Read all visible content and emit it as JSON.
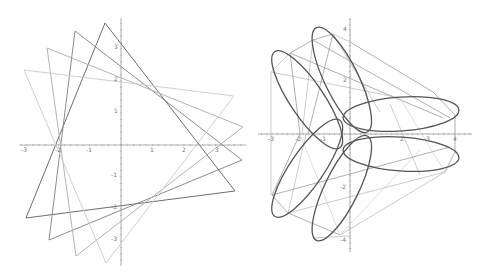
{
  "figure": {
    "width": 485,
    "height": 278,
    "background": "#ffffff"
  },
  "colors": {
    "axis": "#9a9a9a",
    "tick": "#9a9a9a",
    "label": "#7a7a7a",
    "curve": "#555555",
    "line_dark": "#6e6e6e",
    "line_mid": "#8c8c8c",
    "line_light": "#b4b4b4",
    "line_faint": "#cfcfcf"
  },
  "chart_data": [
    {
      "type": "line",
      "title": "",
      "description": "Four overlapping rotated triangles",
      "xlim": [
        -3.1,
        3.9
      ],
      "ylim": [
        -4.0,
        3.9
      ],
      "grid": false,
      "origin_px": [
        121,
        145
      ],
      "unit_px": [
        31.5,
        32.0
      ],
      "axes": {
        "x_axis": {
          "x1": 20,
          "x2": 246,
          "y": 145
        },
        "y_axis": {
          "x": 121,
          "y1": 18,
          "y2": 266
        }
      },
      "x_ticks": [
        {
          "label": "-3",
          "x": 24,
          "y": 152
        },
        {
          "label": "-2",
          "x": 58,
          "y": 152
        },
        {
          "label": "-1",
          "x": 89,
          "y": 152
        },
        {
          "label": "1",
          "x": 152,
          "y": 152
        },
        {
          "label": "2",
          "x": 184,
          "y": 152
        },
        {
          "label": "3",
          "x": 217,
          "y": 152
        }
      ],
      "y_ticks": [
        {
          "label": "3",
          "x": 116,
          "y": 49
        },
        {
          "label": "2",
          "x": 116,
          "y": 81
        },
        {
          "label": "1",
          "x": 116,
          "y": 113
        },
        {
          "label": "-1",
          "x": 114,
          "y": 177
        },
        {
          "label": "-2",
          "x": 114,
          "y": 209
        },
        {
          "label": "-3",
          "x": 114,
          "y": 241
        }
      ],
      "series": [
        {
          "name": "triangle-1",
          "shade": "line_dark",
          "points_px": [
            [
              105,
              23
            ],
            [
              235,
              191
            ],
            [
              26,
              218
            ]
          ],
          "points": [
            [
              -0.5,
              3.8
            ],
            [
              3.6,
              -1.45
            ],
            [
              -3.0,
              -2.3
            ]
          ]
        },
        {
          "name": "triangle-2",
          "shade": "line_mid",
          "points_px": [
            [
              75,
              31
            ],
            [
              242,
              160
            ],
            [
              49,
              240
            ]
          ],
          "points": [
            [
              -1.45,
              3.55
            ],
            [
              3.85,
              -0.5
            ],
            [
              -2.3,
              -3.0
            ]
          ]
        },
        {
          "name": "triangle-3",
          "shade": "line_light",
          "points_px": [
            [
              47,
              48
            ],
            [
              243,
              127
            ],
            [
              76,
              256
            ]
          ],
          "points": [
            [
              -2.35,
              3.0
            ],
            [
              3.85,
              0.55
            ],
            [
              -1.45,
              -3.5
            ]
          ]
        },
        {
          "name": "triangle-4",
          "shade": "line_faint",
          "points_px": [
            [
              24,
              70
            ],
            [
              234,
              96
            ],
            [
              106,
              263
            ]
          ],
          "points": [
            [
              -3.1,
              2.35
            ],
            [
              3.6,
              1.55
            ],
            [
              -0.5,
              -3.7
            ]
          ]
        }
      ]
    },
    {
      "type": "line",
      "title": "",
      "description": "Six-loop curve with three-fold symmetry and inscribed polygon lines",
      "xlim": [
        -3.5,
        4.5
      ],
      "ylim": [
        -4.3,
        4.3
      ],
      "grid": false,
      "origin_px": [
        350,
        134
      ],
      "unit_px": [
        26,
        26
      ],
      "axes": {
        "x_axis": {
          "x1": 258,
          "x2": 472,
          "y": 134
        },
        "y_axis": {
          "x": 350,
          "y1": 18,
          "y2": 252
        }
      },
      "x_ticks": [
        {
          "label": "-3",
          "x": 271,
          "y": 141
        },
        {
          "label": "-2",
          "x": 298,
          "y": 141
        },
        {
          "label": "-1",
          "x": 323,
          "y": 141
        },
        {
          "label": "2",
          "x": 402,
          "y": 141
        },
        {
          "label": "3",
          "x": 428,
          "y": 141
        },
        {
          "label": "4",
          "x": 455,
          "y": 141
        }
      ],
      "y_ticks": [
        {
          "label": "4",
          "x": 345,
          "y": 31
        },
        {
          "label": "2",
          "x": 345,
          "y": 82
        },
        {
          "label": "-2",
          "x": 343,
          "y": 189
        },
        {
          "label": "-4",
          "x": 343,
          "y": 242
        }
      ],
      "loops": {
        "center_px": [
          350,
          134
        ],
        "base_offset_px": [
          51,
          -20
        ],
        "semi_major_px": 58,
        "semi_minor_px": 17,
        "base_angle_deg": -4,
        "symmetry": "D3 (rotations of 120 degrees plus mirror)"
      },
      "lines_px": [
        {
          "shade": "line_mid",
          "pts": [
            [
              350,
              42
            ],
            [
              433,
              92
            ]
          ]
        },
        {
          "shade": "line_mid",
          "pts": [
            [
              313,
              40
            ],
            [
              333,
              34
            ]
          ]
        },
        {
          "shade": "line_mid",
          "pts": [
            [
              290,
              53
            ],
            [
              313,
              40
            ]
          ]
        },
        {
          "shade": "line_light",
          "pts": [
            [
              333,
              34
            ],
            [
              350,
              42
            ]
          ]
        },
        {
          "shade": "line_light",
          "pts": [
            [
              271,
              72
            ],
            [
              290,
              53
            ]
          ]
        },
        {
          "shade": "line_mid",
          "pts": [
            [
              290,
              53
            ],
            [
              443,
              118
            ]
          ]
        },
        {
          "shade": "line_mid",
          "pts": [
            [
              313,
              40
            ],
            [
              450,
              118
            ]
          ]
        },
        {
          "shade": "line_light",
          "pts": [
            [
              271,
              72
            ],
            [
              400,
              98
            ]
          ]
        },
        {
          "shade": "line_mid",
          "pts": [
            [
              290,
              53
            ],
            [
              300,
              134
            ]
          ]
        },
        {
          "shade": "line_mid",
          "pts": [
            [
              333,
              34
            ],
            [
              308,
              134
            ]
          ]
        },
        {
          "shade": "line_light",
          "pts": [
            [
              313,
              40
            ],
            [
              302,
              134
            ]
          ]
        },
        {
          "shade": "line_light",
          "pts": [
            [
              333,
              34
            ],
            [
              380,
              112
            ]
          ]
        },
        {
          "shade": "line_mid",
          "pts": [
            [
              433,
              92
            ],
            [
              455,
              115
            ]
          ]
        },
        {
          "shade": "line_light",
          "pts": [
            [
              271,
              72
            ],
            [
              271,
              195
            ]
          ]
        },
        {
          "shade": "line_mid",
          "pts": [
            [
              455,
              115
            ],
            [
              455,
              152
            ]
          ]
        },
        {
          "shade": "line_mid",
          "pts": [
            [
              272,
              195
            ],
            [
              450,
              147
            ]
          ]
        },
        {
          "shade": "line_mid",
          "pts": [
            [
              272,
              195
            ],
            [
              288,
              213
            ]
          ]
        },
        {
          "shade": "line_mid",
          "pts": [
            [
              288,
              213
            ],
            [
              340,
              235
            ]
          ]
        },
        {
          "shade": "line_light",
          "pts": [
            [
              288,
              213
            ],
            [
              445,
              172
            ]
          ]
        },
        {
          "shade": "line_light",
          "pts": [
            [
              340,
              235
            ],
            [
              445,
              172
            ]
          ]
        },
        {
          "shade": "line_mid",
          "pts": [
            [
              272,
              195
            ],
            [
              300,
              134
            ]
          ]
        },
        {
          "shade": "line_light",
          "pts": [
            [
              288,
              213
            ],
            [
              306,
              134
            ]
          ]
        },
        {
          "shade": "line_light",
          "pts": [
            [
              313,
              238
            ],
            [
              350,
              236
            ]
          ]
        },
        {
          "shade": "line_mid",
          "pts": [
            [
              445,
              172
            ],
            [
              455,
              152
            ]
          ]
        },
        {
          "shade": "line_light",
          "pts": [
            [
              420,
              175
            ],
            [
              390,
              104
            ]
          ]
        },
        {
          "shade": "line_faint",
          "pts": [
            [
              340,
              235
            ],
            [
              420,
              150
            ]
          ]
        },
        {
          "shade": "line_faint",
          "pts": [
            [
              300,
              134
            ],
            [
              340,
              235
            ]
          ]
        },
        {
          "shade": "line_faint",
          "pts": [
            [
              400,
              98
            ],
            [
              445,
              172
            ]
          ]
        }
      ]
    }
  ]
}
